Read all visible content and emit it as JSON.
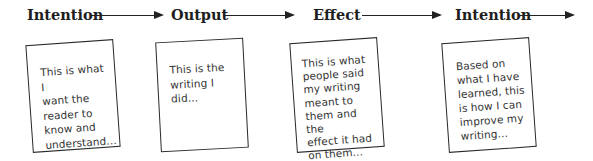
{
  "diagram": {
    "stages": [
      {
        "label": "Intention"
      },
      {
        "label": "Output"
      },
      {
        "label": "Effect"
      },
      {
        "label": "Intention"
      }
    ],
    "cards": [
      {
        "text": "This is what I\nwant the\nreader to\nknow and\nunderstand..."
      },
      {
        "text": "This is the\nwriting I did..."
      },
      {
        "text": "This is what\npeople said\nmy writing\nmeant to\nthem and the\neffect it had\non them..."
      },
      {
        "text": "Based on\nwhat I have\nlearned, this\nis how I can\nimprove my\nwriting..."
      }
    ],
    "colors": {
      "line": "#222222",
      "text": "#1e1e1e",
      "card_border": "#2a2a2a"
    }
  }
}
